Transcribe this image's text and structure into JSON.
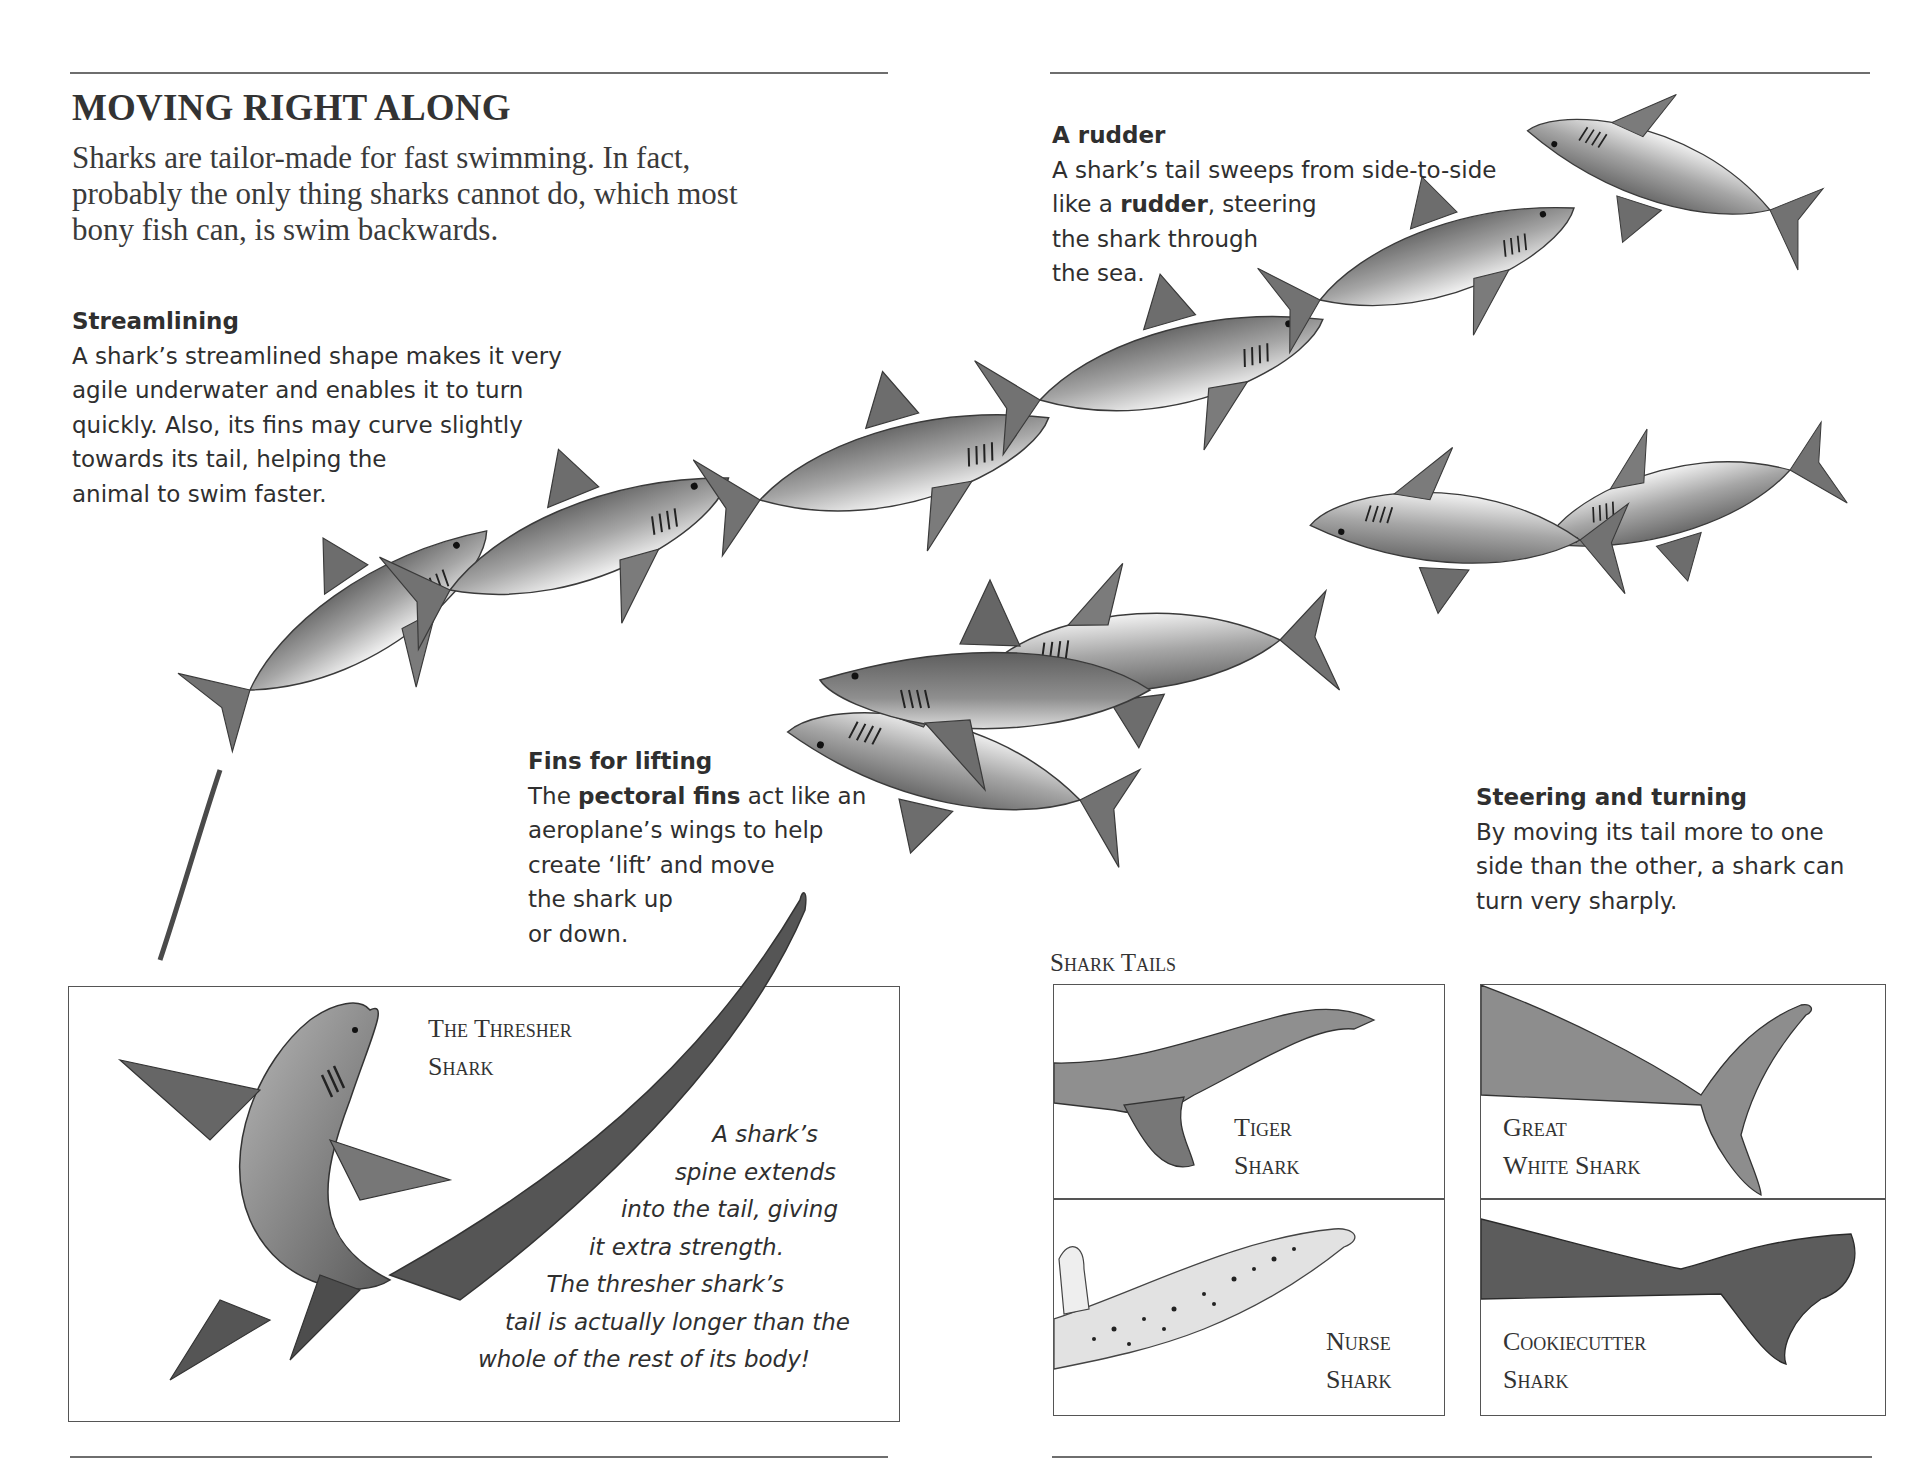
{
  "page": {
    "title": "MOVING RIGHT ALONG",
    "intro_lines": [
      "Sharks are tailor-made for fast swimming. In fact,",
      "probably the only thing sharks cannot do, which most",
      "bony fish can, is swim backwards."
    ]
  },
  "captions": {
    "rudder": {
      "heading": "A rudder",
      "line1": "A shark’s tail sweeps from side-to-side",
      "line2_pre": "like a ",
      "line2_bold": "rudder",
      "line2_post": ", steering",
      "line3": "the shark through",
      "line4": "the sea."
    },
    "streamlining": {
      "heading": "Streamlining",
      "lines": [
        "A shark’s streamlined shape makes it very",
        "agile underwater and enables it to turn",
        "quickly. Also, its fins may curve slightly",
        "towards its tail, helping the",
        "animal to swim faster."
      ]
    },
    "fins_for_lifting": {
      "heading": "Fins for lifting",
      "line1_pre": "The ",
      "line1_bold": "pectoral fins",
      "line1_post": " act like an",
      "line2": "aeroplane’s wings to help",
      "line3": "create ‘lift’ and move",
      "line4": "the shark up",
      "line5": "or down."
    },
    "steering": {
      "heading": "Steering and turning",
      "lines": [
        "By moving its tail more to one",
        "side than the other, a shark can",
        "turn very sharply."
      ]
    }
  },
  "thresher_box": {
    "title_lines": [
      "The Thresher",
      "Shark"
    ],
    "note_lines": [
      "A shark’s",
      "spine extends",
      "into the tail, giving",
      "it extra strength.",
      "The thresher shark’s",
      "tail is actually longer than the",
      "whole of the rest of its body!"
    ]
  },
  "shark_tails": {
    "heading": "Shark Tails",
    "panels": [
      {
        "id": "tiger",
        "label_lines": [
          "Tiger",
          "Shark"
        ]
      },
      {
        "id": "great-white",
        "label_lines": [
          "Great",
          "White Shark"
        ]
      },
      {
        "id": "nurse",
        "label_lines": [
          "Nurse",
          "Shark"
        ]
      },
      {
        "id": "cookiecutter",
        "label_lines": [
          "Cookiecutter",
          "Shark"
        ]
      }
    ]
  },
  "colors": {
    "text": "#2f2f2f",
    "rule": "#6e6e6e",
    "shark_dark": "#5a5a5a",
    "shark_mid": "#8c8c8c",
    "shark_light": "#d6d6d6",
    "belly": "#f4f4f4"
  }
}
